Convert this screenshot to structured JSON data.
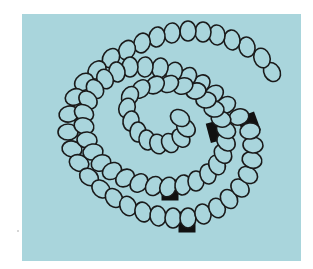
{
  "figure": {
    "background_color": "#a9d5dc",
    "bead_stroke_color": "#1a1a1a",
    "bead_fill_color": "#a9d5dc",
    "marker_color": "#111111",
    "bead_rx": 8,
    "bead_ry": 10,
    "beads": [
      [
        272,
        72,
        -30
      ],
      [
        262,
        58,
        -20
      ],
      [
        247,
        47,
        -12
      ],
      [
        232,
        40,
        -8
      ],
      [
        217,
        35,
        -4
      ],
      [
        203,
        32,
        0
      ],
      [
        188,
        31,
        0
      ],
      [
        172,
        33,
        4
      ],
      [
        157,
        37,
        10
      ],
      [
        142,
        43,
        18
      ],
      [
        127,
        50,
        26
      ],
      [
        111,
        58,
        34
      ],
      [
        97,
        70,
        44
      ],
      [
        84,
        82,
        54
      ],
      [
        75,
        97,
        66
      ],
      [
        69,
        114,
        78
      ],
      [
        68,
        132,
        90
      ],
      [
        72,
        149,
        100
      ],
      [
        79,
        163,
        112
      ],
      [
        89,
        177,
        124
      ],
      [
        101,
        189,
        134
      ],
      [
        114,
        198,
        146
      ],
      [
        128,
        206,
        156
      ],
      [
        143,
        212,
        164
      ],
      [
        158,
        216,
        172
      ],
      [
        173,
        218,
        180
      ],
      [
        188,
        218,
        0
      ],
      [
        203,
        214,
        -12
      ],
      [
        217,
        208,
        -22
      ],
      [
        229,
        199,
        -34
      ],
      [
        240,
        188,
        -46
      ],
      [
        248,
        175,
        -60
      ],
      [
        252,
        160,
        -74
      ],
      [
        253,
        145,
        -86
      ],
      [
        250,
        131,
        -98
      ],
      [
        239,
        117,
        -108
      ],
      [
        226,
        105,
        -118
      ],
      [
        214,
        94,
        -128
      ],
      [
        201,
        84,
        -138
      ],
      [
        188,
        77,
        -148
      ],
      [
        174,
        72,
        -158
      ],
      [
        160,
        68,
        -168
      ],
      [
        145,
        67,
        -176
      ],
      [
        130,
        67,
        180
      ],
      [
        117,
        72,
        170
      ],
      [
        105,
        79,
        158
      ],
      [
        95,
        89,
        146
      ],
      [
        88,
        100,
        134
      ],
      [
        84,
        113,
        120
      ],
      [
        84,
        126,
        106
      ],
      [
        87,
        140,
        94
      ],
      [
        93,
        152,
        82
      ],
      [
        101,
        163,
        70
      ],
      [
        112,
        171,
        60
      ],
      [
        125,
        178,
        50
      ],
      [
        139,
        183,
        40
      ],
      [
        154,
        186,
        30
      ],
      [
        168,
        187,
        20
      ],
      [
        183,
        185,
        10
      ],
      [
        196,
        181,
        0
      ],
      [
        208,
        174,
        -12
      ],
      [
        217,
        165,
        -24
      ],
      [
        223,
        154,
        -36
      ],
      [
        226,
        142,
        -48
      ],
      [
        226,
        130,
        -60
      ],
      [
        221,
        119,
        -72
      ],
      [
        214,
        109,
        -82
      ],
      [
        206,
        100,
        -92
      ],
      [
        196,
        91,
        -100
      ],
      [
        183,
        86,
        -110
      ],
      [
        169,
        84,
        -120
      ],
      [
        155,
        85,
        -130
      ],
      [
        141,
        89,
        -140
      ],
      [
        130,
        96,
        -150
      ],
      [
        127,
        108,
        -160
      ],
      [
        131,
        121,
        -170
      ],
      [
        138,
        132,
        180
      ],
      [
        147,
        140,
        170
      ],
      [
        158,
        144,
        160
      ],
      [
        170,
        143,
        150
      ],
      [
        181,
        138,
        140
      ],
      [
        186,
        128,
        130
      ],
      [
        180,
        118,
        120
      ]
    ],
    "markers": [
      {
        "x": 217,
        "y": 131,
        "w": 18,
        "h": 20,
        "rot": -15
      },
      {
        "x": 249,
        "y": 124,
        "w": 18,
        "h": 20,
        "rot": -20
      },
      {
        "x": 170,
        "y": 190,
        "w": 17,
        "h": 21,
        "rot": 0
      },
      {
        "x": 187,
        "y": 222,
        "w": 17,
        "h": 21,
        "rot": 0
      }
    ]
  }
}
